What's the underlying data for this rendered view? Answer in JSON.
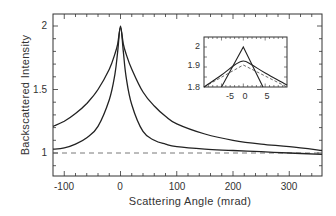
{
  "chart_data": {
    "type": "line",
    "title": "",
    "xlabel": "Scattering Angle (mrad)",
    "ylabel": "Backscattered Intensity",
    "xlim": [
      -120,
      360
    ],
    "ylim": [
      0.8,
      2.1
    ],
    "xticks": [
      -100,
      0,
      100,
      200,
      300
    ],
    "yticks": [
      1,
      1.5,
      2
    ],
    "xtick_labels": [
      "-100",
      "0",
      "100",
      "200",
      "300"
    ],
    "ytick_labels": [
      "1",
      "1.5",
      "2"
    ],
    "grid": false,
    "legend": null,
    "reference_line": {
      "y": 1.0,
      "style": "dashed"
    },
    "series": [
      {
        "name": "broad cone",
        "x": [
          -120,
          -100,
          -80,
          -60,
          -40,
          -20,
          -10,
          -5,
          0,
          5,
          10,
          20,
          40,
          60,
          80,
          100,
          150,
          200,
          250,
          300,
          360
        ],
        "values": [
          1.21,
          1.25,
          1.31,
          1.39,
          1.5,
          1.66,
          1.78,
          1.86,
          1.99,
          1.86,
          1.78,
          1.66,
          1.48,
          1.37,
          1.29,
          1.23,
          1.15,
          1.1,
          1.07,
          1.05,
          1.02
        ]
      },
      {
        "name": "narrow cone",
        "x": [
          -120,
          -100,
          -80,
          -60,
          -40,
          -20,
          -10,
          -5,
          0,
          5,
          10,
          20,
          40,
          60,
          80,
          100,
          150,
          200,
          250,
          300,
          360
        ],
        "values": [
          1.03,
          1.04,
          1.07,
          1.12,
          1.21,
          1.42,
          1.62,
          1.8,
          2.0,
          1.8,
          1.6,
          1.38,
          1.17,
          1.1,
          1.07,
          1.05,
          1.03,
          1.02,
          1.01,
          1.0,
          0.99
        ]
      }
    ],
    "inset": {
      "xlim": [
        -9,
        10
      ],
      "ylim": [
        1.8,
        2.05
      ],
      "xticks": [
        -5,
        0,
        5
      ],
      "yticks": [
        1.8,
        1.9,
        2
      ],
      "xtick_labels": [
        "-5",
        "0",
        "5"
      ],
      "ytick_labels": [
        "1.8",
        "1.9",
        "2"
      ],
      "series": [
        {
          "name": "narrow cone (triangular peak)",
          "x": [
            -5,
            0,
            4.5
          ],
          "values": [
            1.8,
            2.0,
            1.8
          ]
        },
        {
          "name": "broad cone (rounded peak)",
          "x": [
            -9,
            -5,
            -2,
            0,
            2,
            5,
            10
          ],
          "values": [
            1.8,
            1.86,
            1.91,
            1.93,
            1.91,
            1.87,
            1.81
          ]
        },
        {
          "name": "linear fit",
          "x": [
            -9,
            0,
            10
          ],
          "values": [
            1.8,
            1.91,
            1.8
          ]
        }
      ]
    }
  },
  "labels": {
    "xlabel": "Scattering Angle (mrad)",
    "ylabel": "Backscattered Intensity",
    "yticks": [
      "2",
      "1.5",
      "1"
    ],
    "xticks": [
      "-100",
      "0",
      "100",
      "200",
      "300"
    ],
    "inset_yticks": [
      "2",
      "1.9",
      "1.8"
    ],
    "inset_xticks": [
      "-5",
      "0",
      "5"
    ]
  }
}
